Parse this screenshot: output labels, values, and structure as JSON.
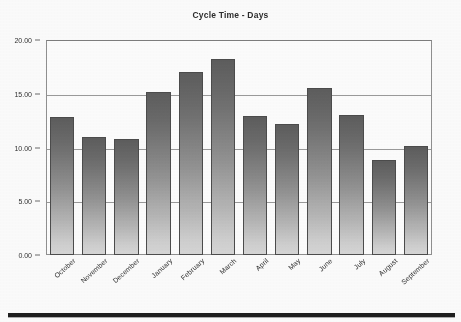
{
  "chart_data": {
    "type": "bar",
    "title": "Cycle Time - Days",
    "xlabel": "",
    "ylabel": "",
    "ylim": [
      0,
      20
    ],
    "yticks": [
      0,
      5,
      10,
      15,
      20
    ],
    "ytick_labels": [
      "0.00",
      "5.00",
      "10.00",
      "15.00",
      "20.00"
    ],
    "grid": true,
    "legend": "none",
    "categories": [
      "October",
      "November",
      "December",
      "January",
      "February",
      "March",
      "April",
      "May",
      "June",
      "July",
      "August",
      "September"
    ],
    "values": [
      12.8,
      11.0,
      10.8,
      15.2,
      17.0,
      18.2,
      12.9,
      12.2,
      15.5,
      13.0,
      8.8,
      10.1
    ],
    "series": [
      {
        "name": "Cycle Time - Days",
        "values": [
          12.8,
          11.0,
          10.8,
          15.2,
          17.0,
          18.2,
          12.9,
          12.2,
          15.5,
          13.0,
          8.8,
          10.1
        ]
      }
    ],
    "bar_fill": "#8d8d8d",
    "bar_outline": "#4a4a4a",
    "axis_color": "#8f8f8f",
    "text_color": "#2f2f2f"
  }
}
